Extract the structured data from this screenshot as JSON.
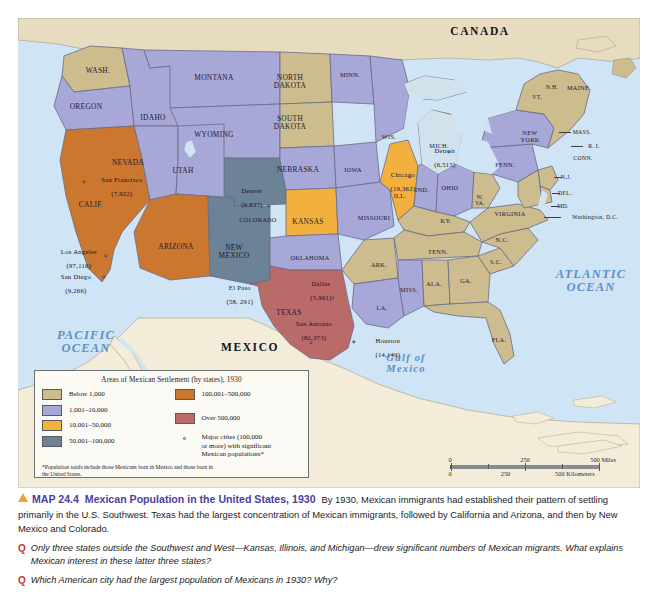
{
  "figure": {
    "countries": [
      {
        "name": "CANADA",
        "x": 462,
        "y": 14
      },
      {
        "name": "MEXICO",
        "x": 232,
        "y": 330
      }
    ],
    "oceans": [
      {
        "name": "PACIFIC\nOCEAN",
        "x": 68,
        "y": 324,
        "size": "lg"
      },
      {
        "name": "ATLANTIC\nOCEAN",
        "x": 573,
        "y": 263,
        "size": "lg"
      },
      {
        "name": "Gulf of\nMexico",
        "x": 388,
        "y": 346,
        "size": "md"
      }
    ],
    "states": [
      {
        "abbr": "WASH.",
        "x": 80,
        "y": 53
      },
      {
        "abbr": "OREGON",
        "x": 68,
        "y": 89
      },
      {
        "abbr": "IDAHO",
        "x": 135,
        "y": 100
      },
      {
        "abbr": "MONTANA",
        "x": 196,
        "y": 60
      },
      {
        "abbr": "WYOMING",
        "x": 196,
        "y": 117
      },
      {
        "abbr": "NEVADA",
        "x": 110,
        "y": 145
      },
      {
        "abbr": "UTAH",
        "x": 165,
        "y": 153
      },
      {
        "abbr": "CALIF.",
        "x": 73,
        "y": 187
      },
      {
        "abbr": "ARIZONA",
        "x": 158,
        "y": 229
      },
      {
        "abbr": "COLORADO",
        "x": 240,
        "y": 202
      },
      {
        "abbr": "NEW\nMEXICO",
        "x": 216,
        "y": 234
      },
      {
        "abbr": "NORTH\nDAKOTA",
        "x": 272,
        "y": 64
      },
      {
        "abbr": "SOUTH\nDAKOTA",
        "x": 272,
        "y": 105
      },
      {
        "abbr": "NEBRASKA",
        "x": 280,
        "y": 152
      },
      {
        "abbr": "KANSAS",
        "x": 290,
        "y": 204
      },
      {
        "abbr": "OKLAHOMA",
        "x": 292,
        "y": 240
      },
      {
        "abbr": "TEXAS",
        "x": 271,
        "y": 295
      },
      {
        "abbr": "MINN.",
        "x": 332,
        "y": 57
      },
      {
        "abbr": "IOWA",
        "x": 335,
        "y": 152
      },
      {
        "abbr": "MISSOURI",
        "x": 356,
        "y": 200
      },
      {
        "abbr": "ARK.",
        "x": 361,
        "y": 247
      },
      {
        "abbr": "LA.",
        "x": 364,
        "y": 290
      },
      {
        "abbr": "WIS.",
        "x": 371,
        "y": 119
      },
      {
        "abbr": "ILL.",
        "x": 382,
        "y": 178
      },
      {
        "abbr": "MICH.",
        "x": 421,
        "y": 128
      },
      {
        "abbr": "IND.",
        "x": 404,
        "y": 172
      },
      {
        "abbr": "OHIO",
        "x": 432,
        "y": 170
      },
      {
        "abbr": "KY.",
        "x": 428,
        "y": 203
      },
      {
        "abbr": "TENN.",
        "x": 420,
        "y": 234
      },
      {
        "abbr": "MISS.",
        "x": 391,
        "y": 272
      },
      {
        "abbr": "ALA.",
        "x": 416,
        "y": 266
      },
      {
        "abbr": "GA.",
        "x": 448,
        "y": 263
      },
      {
        "abbr": "FLA.",
        "x": 481,
        "y": 322
      },
      {
        "abbr": "S.C.",
        "x": 478,
        "y": 244
      },
      {
        "abbr": "N.C.",
        "x": 484,
        "y": 222
      },
      {
        "abbr": "W.\nVA.",
        "x": 462,
        "y": 182
      },
      {
        "abbr": "PENN.",
        "x": 487,
        "y": 147
      },
      {
        "abbr": "NEW\nYORK",
        "x": 512,
        "y": 119
      },
      {
        "abbr": "VT.",
        "x": 519,
        "y": 79
      },
      {
        "abbr": "N.H.",
        "x": 534,
        "y": 69
      },
      {
        "abbr": "MAINE",
        "x": 560,
        "y": 70
      },
      {
        "abbr": "MASS.",
        "x": 564,
        "y": 114
      },
      {
        "abbr": "R. I.",
        "x": 576,
        "y": 128
      },
      {
        "abbr": "CONN.",
        "x": 565,
        "y": 140
      },
      {
        "abbr": "N.J.",
        "x": 548,
        "y": 159
      },
      {
        "abbr": "DEL.",
        "x": 547,
        "y": 175
      },
      {
        "abbr": "MD.",
        "x": 545,
        "y": 188
      },
      {
        "abbr": "VIRGINIA",
        "x": 492,
        "y": 196
      },
      {
        "abbr": "Washington, D.C.",
        "x": 577,
        "y": 199
      }
    ],
    "cities": [
      {
        "name": "San Francisco",
        "value": "(7,922)",
        "tx": 60,
        "ty": 169,
        "dx": 50,
        "dy": 164,
        "align": "left"
      },
      {
        "name": "Los Angeles",
        "value": "(97,116)",
        "tx": 54,
        "ty": 238,
        "dx": 80,
        "dy": 238,
        "align": "left"
      },
      {
        "name": "San Diego",
        "value": "(9,266)",
        "tx": 55,
        "ty": 263,
        "dx": 82,
        "dy": 258,
        "align": "left"
      },
      {
        "name": "Denver",
        "value": "(6,837)",
        "tx": 220,
        "ty": 179,
        "dx": 243,
        "dy": 188,
        "align": "left"
      },
      {
        "name": "El Paso",
        "value": "(58, 291)",
        "tx": 215,
        "ty": 276,
        "dx": 215,
        "dy": 272,
        "align": "center"
      },
      {
        "name": "Dallas",
        "value": "(5,901)",
        "tx": 297,
        "ty": 273,
        "dx": 310,
        "dy": 281,
        "align": "center"
      },
      {
        "name": "San Antonio",
        "value": "(82,373)",
        "tx": 290,
        "ty": 313,
        "dx": 293,
        "dy": 324,
        "align": "center"
      },
      {
        "name": "Houston",
        "value": "(14,149)",
        "tx": 345,
        "ty": 328,
        "dx": 334,
        "dy": 324,
        "align": "left"
      },
      {
        "name": "Chicago",
        "value": "(19,362)",
        "tx": 379,
        "ty": 164,
        "dx": 389,
        "dy": 160,
        "align": "center"
      },
      {
        "name": "Detroit",
        "value": "(6,515)",
        "tx": 421,
        "ty": 140,
        "dx": 425,
        "dy": 136,
        "align": "center"
      }
    ]
  },
  "legend": {
    "title": "Areas of Mexican Settlement (by states), 1930",
    "left_items": [
      {
        "label": "Below 1,000",
        "color": "#cdbd8e"
      },
      {
        "label": "1,001–10,000",
        "color": "#a8a8d8"
      },
      {
        "label": "10,001–50,000",
        "color": "#f2b13e"
      },
      {
        "label": "50,001–100,000",
        "color": "#6c8296"
      }
    ],
    "right_items": [
      {
        "label": "100,001–500,000",
        "color": "#cb7730"
      },
      {
        "label": "Over 500,000",
        "color": "#bb6a6a"
      }
    ],
    "city_marker_label": "Major cities (100,000\nor more) with significant\nMexican populations*",
    "note": "*Population totals include those Mexicans born in Mexico and those born in\nthe United States."
  },
  "scalebar": {
    "miles": [
      "0",
      "250",
      "500 Miles"
    ],
    "kilometers": [
      "0",
      "250",
      "500 Kilometers"
    ]
  },
  "caption": {
    "map_number": "MAP 24.4",
    "title": "Mexican Population in the United States, 1930",
    "body": "By 1930, Mexican immigrants had established their pattern of settling primarily in the U.S. Southwest. Texas had the largest concentration of Mexican immigrants, followed by California and Arizona, and then by New Mexico and Colorado.",
    "q_mark": "Q",
    "questions": [
      "Only three states outside the Southwest and West—Kansas, Illinois, and Michigan—drew significant numbers of Mexican migrants. What explains Mexican interest in these latter three states?",
      "Which American city had the largest population of Mexicans in 1930? Why?"
    ]
  },
  "colors": {
    "ocean": "#cfe4f4",
    "land_other": "#f3ecd8",
    "tan": "#cdbd8e",
    "periwinkle": "#a8a8d8",
    "amber": "#f2b13e",
    "slate": "#6c8296",
    "orange": "#cb7730",
    "red": "#bb6a6a",
    "accent_purple": "#4a3f9e",
    "accent_red": "#c0392b",
    "accent_gold": "#e8a33d"
  }
}
